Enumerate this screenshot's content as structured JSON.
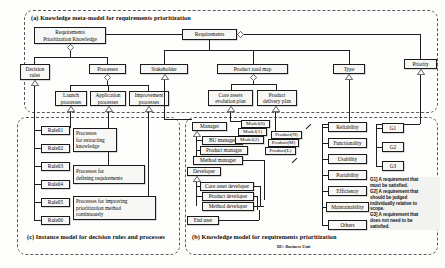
{
  "figure": {
    "regions": [
      {
        "key": "a",
        "caption": "(a) Knowledge meta-model for requirements  prioritization"
      },
      {
        "key": "c",
        "caption": "(c) Instance model for\n     decision rules and processes"
      },
      {
        "key": "b",
        "caption": "(b) Knowledge model for\n     requirements prioritization"
      }
    ],
    "footnote": "BU: Business Unit"
  },
  "meta_model": {
    "root": "Requirements\nPrioritization Knowledge",
    "requirements": "Requirements",
    "decision_rules": "Decision\nrules",
    "processes": "Processes",
    "process_kinds": [
      "Launch\nprocesses",
      "Application\nprocesses",
      "Improvement\nprocesses"
    ],
    "stakeholder": "Stakeholder",
    "product_road_map": "Product road map",
    "type": "Type",
    "priority": "Priority",
    "road_map_plans": [
      "Core assets\nevolution plan",
      "Product\ndelivery plan"
    ]
  },
  "instance_model": {
    "rules": [
      "Rule01",
      "Rule02",
      "Rule03",
      "Rule04",
      "Rule05",
      "Rule06"
    ],
    "processes": [
      "Processes\nfor extracting\nknowledge",
      "Processes for\ndefining requirements",
      "Processes for improving\nprioritization method\ncontinuously"
    ]
  },
  "knowledge_model": {
    "manager": "Manager",
    "manager_roles": [
      "BU manager",
      "Product manager",
      "Method manager"
    ],
    "developer": "Developer",
    "developer_roles": [
      "Core asset developer",
      "Product developer",
      "Method developer"
    ],
    "end_user": "End user",
    "models": [
      "Model(0)",
      "Model(1)",
      "Model(2)"
    ],
    "products": [
      "Product(N)",
      "Product(M)",
      "Product(L)"
    ],
    "types": [
      "Reliability",
      "Functionality",
      "Usability",
      "Portability",
      "Efficiency",
      "Maintainability",
      "Others"
    ],
    "grades": [
      "G1",
      "G2",
      "G3"
    ],
    "grade_note": "G1] A requirement that\nmust be satisfied.\nG2] A requirement that\nshould be judged\nindividually relative to\nscope.\nG3] A requirement that\ndoes not need to be\nsatisfied."
  },
  "colors": {
    "line": "#1d1d1d",
    "box_fill": "#f7f7f5",
    "region_border": "#5a5a5a",
    "note_fill": "#f2f2f0"
  }
}
